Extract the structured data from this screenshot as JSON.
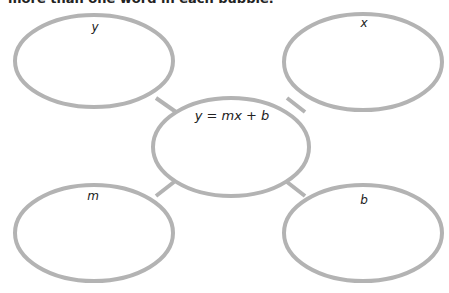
{
  "header": {
    "instruction_text": "more than one word in each bubble."
  },
  "diagram": {
    "type": "concept-web",
    "stroke_color": "#b3b3b3",
    "center": {
      "label": "y = mx + b"
    },
    "bubbles": [
      {
        "position": "top-left",
        "label": "y"
      },
      {
        "position": "top-right",
        "label": "x"
      },
      {
        "position": "bottom-left",
        "label": "m"
      },
      {
        "position": "bottom-right",
        "label": "b"
      }
    ]
  }
}
